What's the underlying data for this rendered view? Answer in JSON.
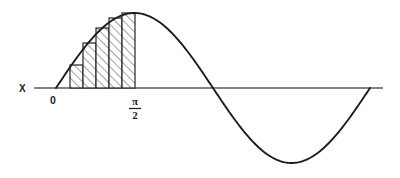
{
  "figure": {
    "background_color": "#ffffff",
    "curve_color": "#1c1c1c",
    "axis_color": "#5a5a5a",
    "rect_outline_color": "#2b2b2b",
    "hatch_color": "#3a3a3a"
  },
  "labels": {
    "axis_label": "X",
    "origin_label": "0",
    "tick_pi_over_2_numerator": "π",
    "tick_pi_over_2_denominator": "2"
  },
  "chart_data": {
    "type": "line",
    "title": "",
    "xlabel": "X",
    "ylabel": "",
    "grid": false,
    "legend": null,
    "annotations": [
      {
        "text": "X",
        "x_px": 23,
        "y_px": 91,
        "role": "axis-name"
      },
      {
        "text": "0",
        "x_px": 56,
        "y_px": 102,
        "role": "x-tick"
      },
      {
        "text": "π/2",
        "x_px": 135,
        "y_px": 104,
        "role": "x-tick"
      }
    ],
    "x_tick_labels": [
      "0",
      "π/2"
    ],
    "x_tick_values": [
      0,
      1.5707963
    ],
    "xlim": [
      -0.35,
      6.6
    ],
    "ylim": [
      -1.25,
      1.25
    ],
    "series": [
      {
        "name": "sin(x)",
        "type": "line",
        "x": [
          0,
          0.3927,
          0.7854,
          1.1781,
          1.5708,
          2.3562,
          3.1416,
          3.927,
          4.7124,
          5.4978,
          6.2832
        ],
        "values": [
          0,
          0.3827,
          0.7071,
          0.9239,
          1.0,
          0.7071,
          0.0,
          -0.7071,
          -1.0,
          -0.7071,
          0.0
        ]
      }
    ],
    "riemann_sum": {
      "method": "right-endpoint",
      "interval": [
        0,
        1.5707963
      ],
      "interval_label": [
        "0",
        "π/2"
      ],
      "n_rectangles": 5,
      "delta_x": 0.3141593,
      "hatched": true,
      "rectangles": [
        {
          "index": 1,
          "x_left": 0.0,
          "x_right": 0.3141593,
          "height": 0.309017
        },
        {
          "index": 2,
          "x_left": 0.3141593,
          "x_right": 0.6283185,
          "height": 0.587785
        },
        {
          "index": 3,
          "x_left": 0.6283185,
          "x_right": 0.9424778,
          "height": 0.809017
        },
        {
          "index": 4,
          "x_left": 0.9424778,
          "x_right": 1.2566371,
          "height": 0.951057
        },
        {
          "index": 5,
          "x_left": 1.2566371,
          "x_right": 1.5707963,
          "height": 1.0
        }
      ]
    }
  },
  "geometry_px": {
    "axis_y": 88,
    "axis_x_start": 34,
    "axis_x_end": 383,
    "origin_x": 56,
    "pi_over_2_x": 135,
    "pi_x": 211,
    "three_pi_over_2_x": 292,
    "two_pi_x": 370,
    "peak_y": 13,
    "trough_y": 166,
    "rect_edges_x": [
      70,
      83,
      96,
      109,
      122,
      135
    ],
    "rect_tops_y": [
      65,
      43,
      28,
      18,
      13
    ]
  }
}
